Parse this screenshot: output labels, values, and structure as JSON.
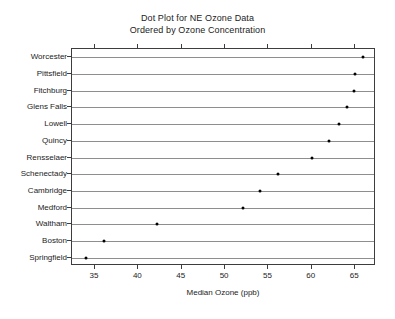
{
  "chart_data": {
    "type": "scatter",
    "title": "Dot Plot for NE Ozone Data",
    "subtitle": "Ordered by Ozone Concentration",
    "xlabel": "Median Ozone (ppb)",
    "ylabel": "",
    "xlim": [
      32.35,
      67.4
    ],
    "xticks": [
      35,
      40,
      45,
      50,
      55,
      60,
      65
    ],
    "xticklabels": [
      "35",
      "40",
      "45",
      "50",
      "55",
      "60",
      "65"
    ],
    "grid": false,
    "legend": null,
    "orientation": "horizontal",
    "categories": [
      "Worcester",
      "Pittsfield",
      "Fitchburg",
      "Glens Falls",
      "Lowell",
      "Quincy",
      "Rensselaer",
      "Schenectady",
      "Cambridge",
      "Medford",
      "Waltham",
      "Boston",
      "Springfield"
    ],
    "values": [
      65.9,
      65.0,
      64.9,
      64.0,
      63.1,
      62.0,
      60.0,
      56.1,
      54.0,
      52.1,
      42.1,
      36.0,
      34.0
    ],
    "points": [
      {
        "label": "Worcester",
        "value": 65.9
      },
      {
        "label": "Pittsfield",
        "value": 65.0
      },
      {
        "label": "Fitchburg",
        "value": 64.9
      },
      {
        "label": "Glens Falls",
        "value": 64.0
      },
      {
        "label": "Lowell",
        "value": 63.1
      },
      {
        "label": "Quincy",
        "value": 62.0
      },
      {
        "label": "Rensselaer",
        "value": 60.0
      },
      {
        "label": "Schenectady",
        "value": 56.1
      },
      {
        "label": "Cambridge",
        "value": 54.0
      },
      {
        "label": "Medford",
        "value": 52.1
      },
      {
        "label": "Waltham",
        "value": 42.1
      },
      {
        "label": "Boston",
        "value": 36.0
      },
      {
        "label": "Springfield",
        "value": 34.0
      }
    ],
    "colors": {
      "dot": "#000000",
      "row_line": "#8e8e8e",
      "frame": "#3d3d3d",
      "text": "#1c1c1c",
      "background": "#ffffff"
    }
  }
}
